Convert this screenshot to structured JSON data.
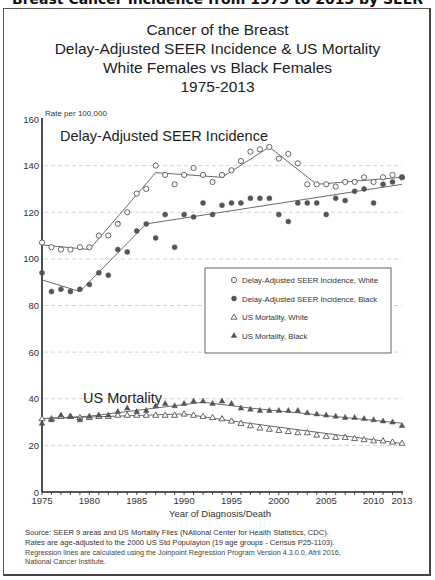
{
  "page": {
    "header_cut": "Breast Cancer Incidence from 1975 to 2013 by SEER"
  },
  "chart_data": {
    "type": "scatter",
    "title": "Cancer of the Breast",
    "title_lines": [
      "Cancer of the Breast",
      "Delay-Adjusted SEER Incidence & US Mortality",
      "White Females  vs Black Females",
      "1975-2013"
    ],
    "ylabel": "Rate per 100,000",
    "xlabel": "Year of Diagnosis/Death",
    "ylim": [
      0,
      160
    ],
    "xlim": [
      1975,
      2013
    ],
    "y_ticks": [
      0,
      20,
      40,
      60,
      80,
      100,
      120,
      140,
      160
    ],
    "x_tick_labels": [
      "1975",
      "1980",
      "1985",
      "1990",
      "1995",
      "2000",
      "2005",
      "2010",
      "2013"
    ],
    "x_tick_values": [
      1975,
      1980,
      1985,
      1990,
      1995,
      2000,
      2005,
      2010,
      2013
    ],
    "grid": "horizontal dashed",
    "annotations": {
      "incidence_label": "Delay-Adjusted SEER Incidence",
      "mortality_label": "US Mortality"
    },
    "legend_position": "inside right-middle",
    "legend": [
      {
        "marker": "open-circle",
        "label": "Delay-Adjusted SEER Incidence, White"
      },
      {
        "marker": "filled-circle",
        "label": "Delay-Adjusted SEER Incidence, Black"
      },
      {
        "marker": "open-triangle",
        "label": "US Mortality, White"
      },
      {
        "marker": "filled-triangle",
        "label": "US Mortality, Black"
      }
    ],
    "x": [
      1975,
      1976,
      1977,
      1978,
      1979,
      1980,
      1981,
      1982,
      1983,
      1984,
      1985,
      1986,
      1987,
      1988,
      1989,
      1990,
      1991,
      1992,
      1993,
      1994,
      1995,
      1996,
      1997,
      1998,
      1999,
      2000,
      2001,
      2002,
      2003,
      2004,
      2005,
      2006,
      2007,
      2008,
      2009,
      2010,
      2011,
      2012,
      2013
    ],
    "series": [
      {
        "name": "Delay-Adjusted SEER Incidence, White",
        "marker": "open-circle",
        "values": [
          107,
          105,
          104,
          104,
          105,
          105,
          110,
          110,
          115,
          120,
          128,
          130,
          140,
          136,
          132,
          136,
          139,
          136,
          133,
          136,
          138,
          142,
          146,
          147,
          148,
          143,
          145,
          141,
          132,
          132,
          132,
          131,
          133,
          133,
          135,
          133,
          135,
          136,
          135
        ],
        "trend": [
          [
            1975,
            106
          ],
          [
            1980,
            104
          ],
          [
            1987,
            137
          ],
          [
            1994,
            135
          ],
          [
            1999,
            148
          ],
          [
            2004,
            132
          ],
          [
            2013,
            135
          ]
        ]
      },
      {
        "name": "Delay-Adjusted SEER Incidence, Black",
        "marker": "filled-circle",
        "values": [
          94,
          86,
          87,
          86,
          87,
          89,
          94,
          93,
          104,
          103,
          112,
          115,
          109,
          119,
          105,
          119,
          118,
          124,
          119,
          123,
          124,
          124,
          126,
          126,
          126,
          119,
          116,
          124,
          124,
          124,
          119,
          126,
          125,
          129,
          130,
          124,
          132,
          133,
          135
        ],
        "trend": [
          [
            1975,
            91
          ],
          [
            1979,
            86
          ],
          [
            1986,
            115
          ],
          [
            2013,
            132
          ]
        ]
      },
      {
        "name": "US Mortality, White",
        "marker": "open-triangle",
        "values": [
          31.5,
          31.5,
          32.5,
          32.5,
          32,
          32,
          32.5,
          32.5,
          33,
          33,
          33,
          33,
          33,
          33,
          33,
          33.5,
          33,
          32.5,
          32,
          31.5,
          30.5,
          29.5,
          28.5,
          27.5,
          27,
          26.5,
          26,
          25.5,
          25.5,
          24.5,
          24,
          23.5,
          23.5,
          23,
          22.5,
          22,
          22,
          21.5,
          21
        ],
        "trend": [
          [
            1975,
            31.5
          ],
          [
            1990,
            33.5
          ],
          [
            1995,
            30.5
          ],
          [
            2013,
            20.8
          ]
        ]
      },
      {
        "name": "US Mortality, Black",
        "marker": "filled-triangle",
        "values": [
          29.5,
          31,
          33,
          32.5,
          31,
          32.5,
          33,
          33,
          34.5,
          36,
          34.5,
          35,
          37,
          38,
          37,
          38,
          39,
          39,
          38,
          39,
          38,
          36,
          35.5,
          35,
          35,
          35,
          35,
          35,
          34,
          33.5,
          33,
          32.5,
          32,
          32,
          31.5,
          31,
          30.5,
          30,
          28.5
        ],
        "trend": [
          [
            1975,
            31.5
          ],
          [
            1980,
            32.5
          ],
          [
            1992,
            38.5
          ],
          [
            1997,
            36
          ],
          [
            2013,
            29.5
          ]
        ]
      }
    ]
  },
  "footnotes": [
    "Source: SEER 9 areas and US Mortality Files (NAtional Center for Health Statistics, CDC).",
    "Rates are age-adjusted to the 2000 US Std Populayion (19 age groups - Census P25-1103).",
    "Regression lines are calculated using the Joinpoint Regression Program Version 4.3.0.0, Afril 2016,",
    "National Cancer Institute."
  ]
}
